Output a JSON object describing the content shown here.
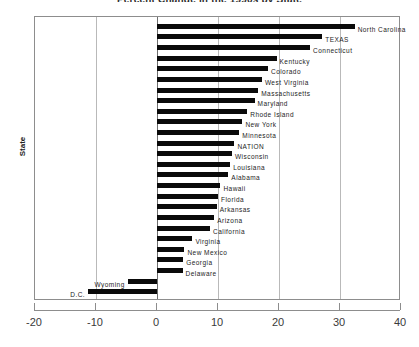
{
  "chart_data": {
    "type": "bar",
    "orientation": "horizontal",
    "title": "Percent Change in the 1990s by State",
    "xlabel": "",
    "ylabel": "State",
    "xlim": [
      -20,
      40
    ],
    "xticks": [
      -20,
      -10,
      0,
      10,
      20,
      30,
      40
    ],
    "xticklabels": [
      "-20",
      "-10",
      "0",
      "10",
      "20",
      "30",
      "40"
    ],
    "grid": true,
    "legend": "none",
    "categories": [
      "North Carolina",
      "TEXAS",
      "Connecticut",
      "Kentucky",
      "Colorado",
      "West Virginia",
      "Massachusetts",
      "Maryland",
      "Rhode Island",
      "New York",
      "Minnesota",
      "NATION",
      "Wisconsin",
      "Louisiana",
      "Alabama",
      "Hawaii",
      "Florida",
      "Arkansas",
      "Arizona",
      "California",
      "Virginia",
      "New Mexico",
      "Georgia",
      "Delaware",
      "Wyoming",
      "D.C."
    ],
    "values": [
      32.4,
      27.1,
      25.1,
      19.6,
      18.2,
      17.2,
      16.6,
      16.0,
      14.8,
      14.0,
      13.5,
      12.7,
      12.3,
      12.0,
      11.7,
      10.4,
      10.0,
      9.8,
      9.4,
      8.7,
      5.8,
      4.5,
      4.3,
      4.2,
      -4.8,
      -11.3
    ],
    "bar_color": "#0a0a0a"
  },
  "axis": {
    "y_caption": "State"
  }
}
